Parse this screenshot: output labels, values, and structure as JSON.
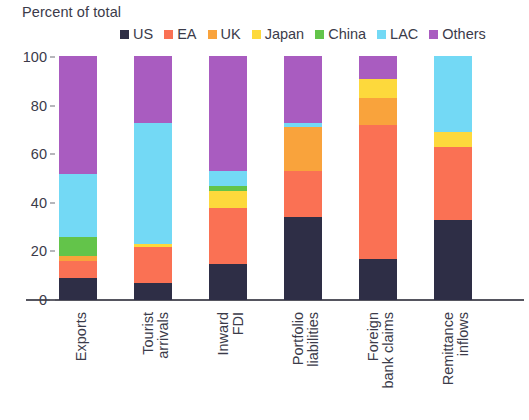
{
  "chart_data": {
    "type": "bar",
    "subtype": "stacked-bar-100-percent",
    "title": "",
    "ylabel": "Percent of total",
    "xlabel": "",
    "ylim": [
      0,
      100
    ],
    "yticks": [
      0,
      20,
      40,
      60,
      80,
      100
    ],
    "grid": false,
    "legend_position": "top",
    "categories": [
      "Exports",
      "Tourist arrivals",
      "Inward FDI",
      "Portfolio liabilities",
      "Foreign bank claims",
      "Remittance inflows"
    ],
    "category_lines": [
      [
        "Exports"
      ],
      [
        "Tourist",
        "arrivals"
      ],
      [
        "Inward",
        "FDI"
      ],
      [
        "Portfolio",
        "liabilities"
      ],
      [
        "Foreign",
        "bank claims"
      ],
      [
        "Remittance",
        "inflows"
      ]
    ],
    "series": [
      {
        "name": "US",
        "color": "#2e2e46",
        "values": [
          9,
          7,
          15,
          34,
          17,
          33
        ]
      },
      {
        "name": "EA",
        "color": "#fa7154",
        "values": [
          7,
          15,
          23,
          19,
          55,
          30
        ]
      },
      {
        "name": "UK",
        "color": "#f9a33c",
        "values": [
          2,
          0,
          0,
          18,
          11,
          0
        ]
      },
      {
        "name": "Japan",
        "color": "#fdd93c",
        "values": [
          0,
          1,
          7,
          0,
          8,
          6
        ]
      },
      {
        "name": "China",
        "color": "#63c council",
        "values": [
          8,
          0,
          2,
          0,
          0,
          0
        ]
      },
      {
        "name": "LAC",
        "color": "#73d9f5",
        "values": [
          26,
          50,
          6,
          2,
          0,
          31
        ]
      },
      {
        "name": "Others",
        "color": "#a95cc0",
        "values": [
          48,
          27,
          47,
          27,
          9,
          0
        ]
      }
    ]
  },
  "legend": {
    "items": [
      {
        "label": "US",
        "color": "#2e2e46"
      },
      {
        "label": "EA",
        "color": "#fa7154"
      },
      {
        "label": "UK",
        "color": "#f9a33c"
      },
      {
        "label": "Japan",
        "color": "#fdd93c"
      },
      {
        "label": "China",
        "color": "#63c44a"
      },
      {
        "label": "LAC",
        "color": "#73d9f5"
      },
      {
        "label": "Others",
        "color": "#a95cc0"
      }
    ]
  },
  "axis": {
    "title": "Percent of total",
    "yticks": [
      "100",
      "80",
      "60",
      "40",
      "20",
      "0"
    ]
  }
}
